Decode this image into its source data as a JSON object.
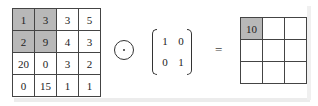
{
  "input_matrix": {
    "rows": [
      [
        "1",
        "3",
        "3",
        "5"
      ],
      [
        "2",
        "9",
        "4",
        "3"
      ],
      [
        "20",
        "0",
        "3",
        "2"
      ],
      [
        "0",
        "15",
        "1",
        "1"
      ]
    ],
    "highlighted_cells": [
      [
        0,
        0
      ],
      [
        0,
        1
      ],
      [
        1,
        0
      ],
      [
        1,
        1
      ]
    ],
    "highlight_color": "#b8b8b8"
  },
  "operator": {
    "symbol": "⊙",
    "name": "element-wise product"
  },
  "kernel": {
    "rows": [
      [
        "1",
        "0"
      ],
      [
        "0",
        "1"
      ]
    ]
  },
  "equals": "=",
  "output_matrix": {
    "rows": [
      [
        "10",
        "",
        ""
      ],
      [
        "",
        "",
        ""
      ],
      [
        "",
        "",
        ""
      ]
    ],
    "highlighted_cells": [
      [
        0,
        0
      ]
    ]
  }
}
